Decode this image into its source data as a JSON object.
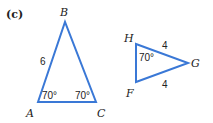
{
  "part_label": "(c)",
  "stroke_color": "#3a78d6",
  "triangle_abc": {
    "vertices": {
      "A": "A",
      "B": "B",
      "C": "C"
    },
    "side_AB": "6",
    "angle_A": "70°",
    "angle_C": "70°"
  },
  "triangle_fgh": {
    "vertices": {
      "F": "F",
      "G": "G",
      "H": "H"
    },
    "side_HG": "4",
    "side_FG": "4",
    "angle_H": "70°"
  }
}
